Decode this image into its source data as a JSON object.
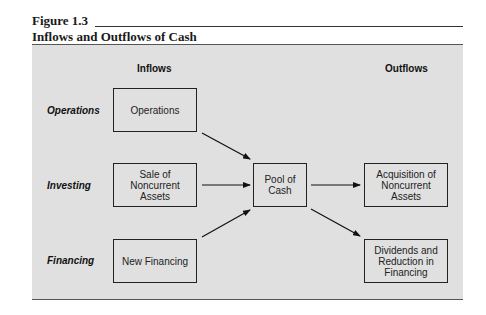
{
  "figure": {
    "label": "Figure 1.3",
    "title": "Inflows and Outflows of Cash"
  },
  "columns": {
    "inflows": "Inflows",
    "outflows": "Outflows"
  },
  "rows": {
    "operations": "Operations",
    "investing": "Investing",
    "financing": "Financing"
  },
  "nodes": {
    "operations": "Operations",
    "sale_noncurrent": "Sale of\nNoncurrent\nAssets",
    "new_financing": "New Financing",
    "pool_of_cash": "Pool of\nCash",
    "acquisition_noncurrent": "Acquisition of\nNoncurrent\nAssets",
    "dividends_reduction": "Dividends and\nReduction in\nFinancing"
  },
  "edges": [
    {
      "from": "operations",
      "to": "pool_of_cash"
    },
    {
      "from": "sale_noncurrent",
      "to": "pool_of_cash"
    },
    {
      "from": "new_financing",
      "to": "pool_of_cash"
    },
    {
      "from": "pool_of_cash",
      "to": "acquisition_noncurrent"
    },
    {
      "from": "pool_of_cash",
      "to": "dividends_reduction"
    }
  ]
}
